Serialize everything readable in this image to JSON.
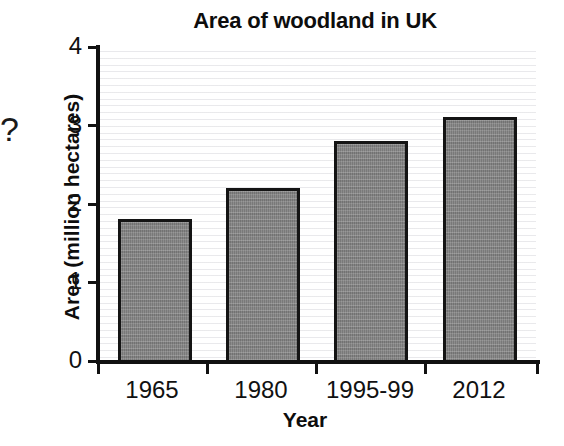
{
  "margin_annotation": "?",
  "axis": {
    "y_ticks": [
      "4",
      "3",
      "2",
      "1",
      "0"
    ],
    "x_tick_labels": [
      "1965",
      "1980",
      "1995-99",
      "2012"
    ]
  },
  "chart_data": {
    "type": "bar",
    "title": "Area of woodland in UK",
    "xlabel": "Year",
    "ylabel": "Area (million hectares)",
    "categories": [
      "1965",
      "1980",
      "1995-99",
      "2012"
    ],
    "values": [
      1.8,
      2.2,
      2.8,
      3.1
    ],
    "ylim": [
      0,
      4
    ],
    "yticks": [
      0,
      1,
      2,
      3,
      4
    ],
    "grid": true,
    "legend": null,
    "bar_color": "#7f7f7f",
    "bar_edge_color": "#141414",
    "background_color": "#ffffff"
  }
}
